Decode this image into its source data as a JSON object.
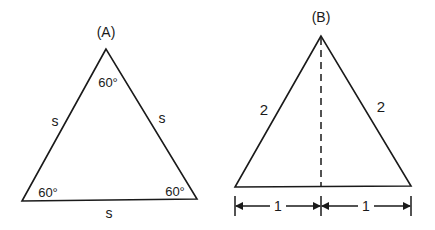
{
  "diagram": {
    "panels": [
      {
        "label": "(A)",
        "shape": "equilateral triangle",
        "angles": {
          "top": "60°",
          "bottom_left": "60°",
          "bottom_right": "60°"
        },
        "sides": {
          "left": "s",
          "right": "s",
          "bottom": "s"
        }
      },
      {
        "label": "(B)",
        "shape": "equilateral triangle with altitude",
        "sides": {
          "left": "2",
          "right": "2"
        },
        "base_segments": {
          "left": "1",
          "right": "1"
        },
        "altitude": "dashed"
      }
    ],
    "colors": {
      "stroke": "#1a1a1a",
      "background": "#ffffff"
    }
  }
}
